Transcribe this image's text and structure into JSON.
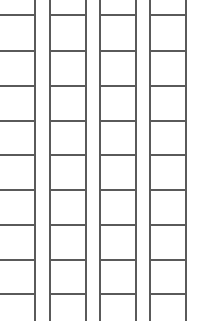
{
  "grid": {
    "line_color": "#5a5a5a",
    "background": "#ffffff",
    "columns": [
      {
        "left": 0,
        "right": 34,
        "has_left_border": false
      },
      {
        "left": 49,
        "right": 85,
        "has_left_border": true
      },
      {
        "left": 99,
        "right": 135,
        "has_left_border": true
      },
      {
        "left": 149,
        "right": 185,
        "has_left_border": true
      }
    ],
    "row_lines_y": [
      14,
      50,
      85,
      120,
      154,
      189,
      224,
      259,
      293
    ]
  }
}
